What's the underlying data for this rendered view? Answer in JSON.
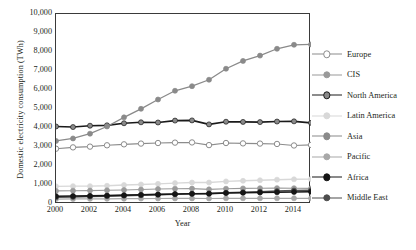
{
  "chart_data": {
    "type": "line",
    "title": "",
    "xlabel": "Year",
    "ylabel": "Domestic electricity consumption (TWh)",
    "x": [
      2000,
      2001,
      2002,
      2003,
      2004,
      2005,
      2006,
      2007,
      2008,
      2009,
      2010,
      2011,
      2012,
      2013,
      2014,
      2015
    ],
    "xtick_labels": [
      "2000",
      "2002",
      "2004",
      "2006",
      "2008",
      "2010",
      "2012",
      "2014"
    ],
    "xtick_values": [
      2000,
      2002,
      2004,
      2006,
      2008,
      2010,
      2012,
      2014
    ],
    "xlim": [
      2000,
      2015
    ],
    "ylim": [
      0,
      10000
    ],
    "ytick_labels": [
      "0",
      "1,000",
      "2,000",
      "3,000",
      "4,000",
      "5,000",
      "6,000",
      "7,000",
      "8,000",
      "9,000",
      "10,000"
    ],
    "ytick_values": [
      0,
      1000,
      2000,
      3000,
      4000,
      5000,
      6000,
      7000,
      8000,
      9000,
      10000
    ],
    "grid": false,
    "legend_position": "right",
    "series": [
      {
        "name": "Europe",
        "color": "#8c8c8c",
        "marker": "open-circle",
        "marker_fill": "#ffffff",
        "line_width": 1.1,
        "values": [
          2910,
          2980,
          3020,
          3090,
          3140,
          3180,
          3210,
          3230,
          3240,
          3100,
          3210,
          3190,
          3180,
          3160,
          3080,
          3110
        ]
      },
      {
        "name": "CIS",
        "color": "#9a9a9a",
        "marker": "filled-circle",
        "marker_fill": "#9a9a9a",
        "line_width": 1.1,
        "values": [
          690,
          700,
          705,
          720,
          740,
          760,
          790,
          805,
          810,
          770,
          805,
          820,
          830,
          835,
          830,
          820
        ]
      },
      {
        "name": "North America",
        "color": "#1a1a1a",
        "marker": "filled-circle",
        "marker_fill": "#8a8a8a",
        "line_width": 1.6,
        "values": [
          4080,
          4050,
          4120,
          4140,
          4250,
          4300,
          4290,
          4390,
          4400,
          4190,
          4330,
          4320,
          4310,
          4340,
          4350,
          4270
        ]
      },
      {
        "name": "Latin America",
        "color": "#d8d8d8",
        "marker": "filled-circle",
        "marker_fill": "#d8d8d8",
        "line_width": 1.4,
        "values": [
          930,
          940,
          940,
          960,
          1000,
          1030,
          1060,
          1100,
          1130,
          1130,
          1190,
          1220,
          1250,
          1280,
          1300,
          1310
        ]
      },
      {
        "name": "Asia",
        "color": "#8a8a8a",
        "marker": "filled-circle",
        "marker_fill": "#8a8a8a",
        "line_width": 1.3,
        "values": [
          3320,
          3450,
          3700,
          4080,
          4560,
          5010,
          5500,
          5960,
          6200,
          6540,
          7120,
          7530,
          7810,
          8170,
          8380,
          8400
        ]
      },
      {
        "name": "Pacific",
        "color": "#a8a8a8",
        "marker": "filled-circle",
        "marker_fill": "#a8a8a8",
        "line_width": 1.2,
        "values": [
          260,
          265,
          270,
          275,
          280,
          285,
          290,
          295,
          295,
          290,
          300,
          300,
          300,
          300,
          300,
          300
        ]
      },
      {
        "name": "Africa",
        "color": "#161616",
        "marker": "filled-circle",
        "marker_fill": "#161616",
        "line_width": 1.6,
        "values": [
          410,
          420,
          430,
          445,
          465,
          485,
          505,
          525,
          540,
          545,
          575,
          590,
          605,
          620,
          635,
          645
        ]
      },
      {
        "name": "Middle East",
        "color": "#4d4d4d",
        "marker": "filled-circle",
        "marker_fill": "#4d4d4d",
        "line_width": 1.5,
        "values": [
          350,
          370,
          390,
          410,
          435,
          460,
          485,
          510,
          535,
          555,
          590,
          620,
          650,
          680,
          705,
          725
        ]
      }
    ]
  }
}
